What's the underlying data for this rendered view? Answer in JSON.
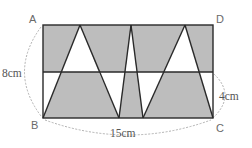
{
  "colors": {
    "background": "#ffffff",
    "shade": "#bdbdbd",
    "line": "#2a2a2a",
    "dashed": "#a8a8a8",
    "label": "#6a6a6a"
  },
  "labels": {
    "A": "A",
    "B": "B",
    "C": "C",
    "D": "D"
  },
  "measurements": {
    "height": "8cm",
    "base": "15cm",
    "lower_strip": "4cm"
  },
  "geometry": {
    "rect": {
      "left": 43,
      "top": 25,
      "right": 213,
      "bottom": 118
    },
    "mid_line_y": 72,
    "top_peaks_x": [
      80,
      131,
      185
    ],
    "bottom_points_x": [
      43,
      119,
      143,
      213
    ]
  }
}
